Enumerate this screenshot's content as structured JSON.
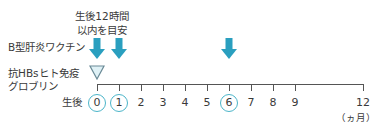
{
  "diagram": {
    "note_line1": "生後12時間",
    "note_line2": "以内を目安",
    "row_vaccine_label": "B型肝炎ワクチン",
    "row_hbig_label_line1": "抗HBsヒト免疫",
    "row_hbig_label_line2": "グロブリン",
    "axis_prefix": "生後",
    "axis_unit": "（ヵ月）",
    "months": [
      "0",
      "1",
      "2",
      "3",
      "4",
      "5",
      "6",
      "7",
      "8",
      "9",
      "12"
    ],
    "circled_months": [
      "0",
      "1",
      "6"
    ],
    "vaccine_doses_months": [
      0,
      1,
      6
    ],
    "hbig_dose_months": [
      0
    ],
    "colors": {
      "arrow": "#2a9fbf",
      "circle": "#4bb5c9",
      "triangle_stroke": "#6a8a96",
      "triangle_fill": "#dff1f6",
      "axis": "#555555"
    }
  }
}
